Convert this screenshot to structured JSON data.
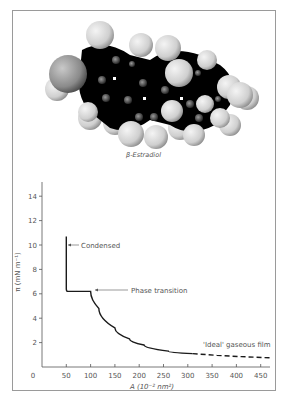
{
  "figure": {
    "molecule_caption": "β-Estradiol",
    "colors": {
      "carbon": "#000000",
      "hydrogen": "#d8d8d8",
      "oxygen": "#8f8f8f",
      "curve": "#1a1a1a",
      "axis": "#555555",
      "frame": "#9a9a9a"
    }
  },
  "chart_data": {
    "type": "line",
    "title": "",
    "xlabel": "A (10⁻² nm²)",
    "ylabel": "π (mN m⁻¹)",
    "xlim": [
      0,
      470
    ],
    "ylim": [
      0,
      15
    ],
    "x_ticks": [
      0,
      50,
      100,
      150,
      200,
      250,
      300,
      350,
      400,
      450
    ],
    "y_ticks": [
      2,
      4,
      6,
      8,
      10,
      12,
      14
    ],
    "grid": false,
    "series": [
      {
        "name": "β-Estradiol monolayer isotherm",
        "style": "solid",
        "x": [
          50,
          50,
          52,
          100,
          117,
          150,
          180,
          210,
          260,
          310
        ],
        "y": [
          10.7,
          6.4,
          6.2,
          6.2,
          4.8,
          3.2,
          2.3,
          1.8,
          1.3,
          1.1
        ]
      },
      {
        "name": "'Ideal' gaseous film",
        "style": "dashed",
        "x": [
          310,
          360,
          410,
          470
        ],
        "y": [
          1.1,
          0.95,
          0.85,
          0.75
        ]
      }
    ],
    "annotations": [
      {
        "text": "Condensed",
        "arrow_to": [
          50,
          10
        ]
      },
      {
        "text": "Phase transition",
        "arrow_to": [
          100,
          6.2
        ]
      },
      {
        "text": "'Ideal' gaseous film",
        "near": [
          380,
          1.4
        ]
      }
    ]
  }
}
